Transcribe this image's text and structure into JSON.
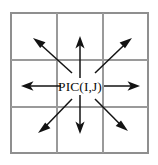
{
  "figure": {
    "title": "PIC(I,J) eight-neighbour direction diagram",
    "center_label": "PIC(I,J)",
    "background_color": "#ffffff",
    "grid": {
      "rows": 3,
      "columns": 3,
      "line_color": "#9a9a9a",
      "border_color": "#8f8f8f",
      "left": 11,
      "top": 13,
      "right": 148,
      "bottom": 153,
      "vertical_lines": [
        11,
        57,
        103,
        148
      ],
      "horizontal_lines": [
        13,
        60,
        107,
        153
      ]
    },
    "arrows": {
      "color": "#131313",
      "count": 8,
      "origin_label": "PIC(I,J)",
      "items": [
        {
          "name": "arrow-north-west",
          "direction": "north-west",
          "from_x": 72,
          "from_y": 73,
          "to_x": 33,
          "to_y": 38
        },
        {
          "name": "arrow-north",
          "direction": "north",
          "from_x": 80,
          "from_y": 78,
          "to_x": 80,
          "to_y": 36
        },
        {
          "name": "arrow-north-east",
          "direction": "north-east",
          "from_x": 95,
          "from_y": 73,
          "to_x": 132,
          "to_y": 38
        },
        {
          "name": "arrow-west",
          "direction": "west",
          "from_x": 61,
          "from_y": 86,
          "to_x": 21,
          "to_y": 86
        },
        {
          "name": "arrow-east",
          "direction": "east",
          "from_x": 104,
          "from_y": 86,
          "to_x": 140,
          "to_y": 86
        },
        {
          "name": "arrow-south-west",
          "direction": "south-west",
          "from_x": 72,
          "from_y": 99,
          "to_x": 38,
          "to_y": 133
        },
        {
          "name": "arrow-south",
          "direction": "south",
          "from_x": 80,
          "from_y": 95,
          "to_x": 80,
          "to_y": 134
        },
        {
          "name": "arrow-south-east",
          "direction": "south-east",
          "from_x": 95,
          "from_y": 99,
          "to_x": 128,
          "to_y": 131
        }
      ]
    }
  }
}
